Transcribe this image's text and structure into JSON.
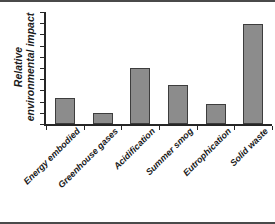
{
  "chart_data": {
    "type": "bar",
    "title": "",
    "subtitle": "",
    "xlabel": "",
    "ylabel": "Relative environmental impact",
    "ylabel_line1": "Relative",
    "ylabel_line2": "environmental impact",
    "categories": [
      "Energy embodied",
      "Greenhouse gases",
      "Acidification",
      "Summer smog",
      "Eutrophication",
      "Solid waste"
    ],
    "values": [
      2.3,
      0.95,
      5.0,
      3.5,
      1.8,
      8.9
    ],
    "ylim": [
      0,
      10
    ],
    "y_tick_count": 10,
    "y_tick_labels": [],
    "grid": false,
    "legend": false,
    "legend_position": "none",
    "bar_color": "#8c8c8c",
    "bar_edge_color": "#3d3d3d",
    "axis_color": "#262626",
    "background_color": "#ffffff"
  },
  "figure": {
    "border_top_color": "#4a4a4a",
    "border_bottom_color": "#4a4a4a"
  }
}
